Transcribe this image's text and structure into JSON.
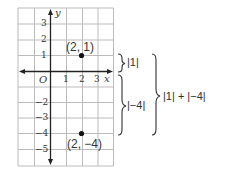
{
  "graph": {
    "axes": {
      "x_label": "x",
      "y_label": "y",
      "origin_label": "O"
    },
    "x_ticks": [
      "1",
      "2",
      "3"
    ],
    "y_ticks": [
      "3",
      "2",
      "1",
      "−2",
      "−3",
      "−4",
      "−5"
    ],
    "points": [
      {
        "label": "(2, 1)",
        "x": 2,
        "y": 1
      },
      {
        "label": "(2, −4)",
        "x": 2,
        "y": -4
      }
    ]
  },
  "braces": {
    "upper_label": "|1|",
    "lower_label": "|−4|",
    "total_label": "|1| + |−4|"
  }
}
